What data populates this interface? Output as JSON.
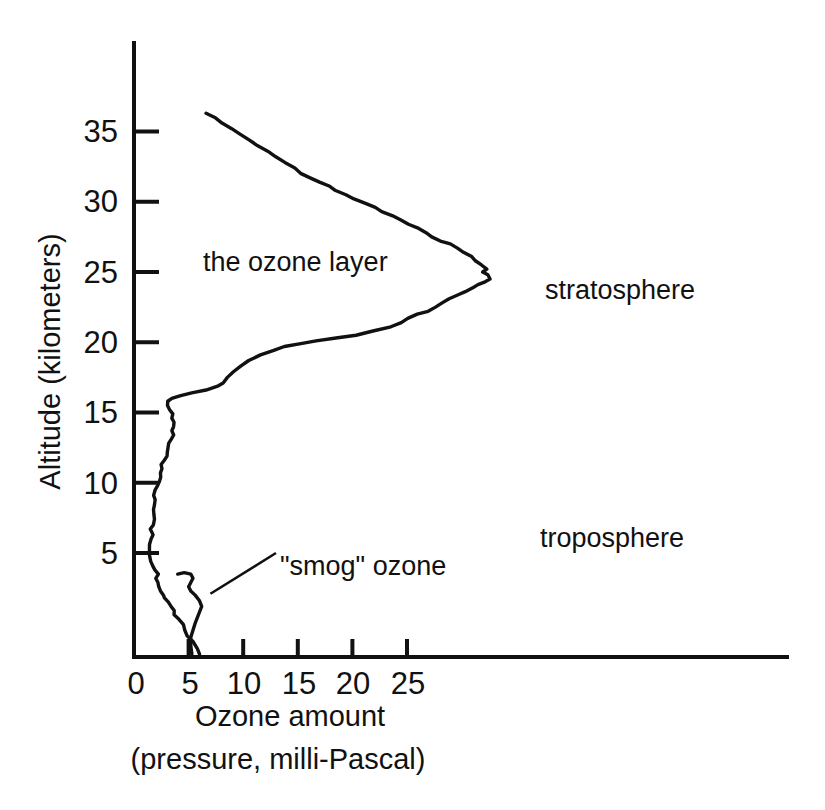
{
  "figure": {
    "background_color": "#ffffff",
    "ink_color": "#111111"
  },
  "axes": {
    "x": {
      "title_line1": "Ozone amount",
      "title_line2": "(pressure, milli-Pascal)",
      "ticks": [
        "0",
        "5",
        "10",
        "15",
        "20",
        "25"
      ],
      "tick_values": [
        0,
        5,
        10,
        15,
        20,
        25
      ],
      "range": [
        0,
        30
      ]
    },
    "y": {
      "title": "Altitude (kilometers)",
      "ticks": [
        "5",
        "10",
        "15",
        "20",
        "25",
        "30",
        "35"
      ],
      "tick_values": [
        5,
        10,
        15,
        20,
        25,
        30,
        35
      ],
      "range": [
        -2.4,
        37
      ]
    }
  },
  "annotations": {
    "ozone_layer": "the ozone layer",
    "stratosphere": "stratosphere",
    "troposphere": "troposphere",
    "smog_ozone": "\"smog\" ozone"
  },
  "chart_data": {
    "type": "line",
    "title": "",
    "xlabel": "Ozone amount (pressure, milli-Pascal)",
    "ylabel": "Altitude (kilometers)",
    "xlim": [
      0,
      30
    ],
    "ylim": [
      -2.4,
      37
    ],
    "xticks": [
      0,
      5,
      10,
      15,
      20,
      25
    ],
    "yticks": [
      5,
      10,
      15,
      20,
      25,
      30,
      35
    ],
    "grid": false,
    "legend": null,
    "orientation": "x = ozone amount, y = altitude",
    "annotations": [
      {
        "text": "the ozone layer",
        "x": 6.3,
        "y": 23.3
      },
      {
        "text": "stratosphere",
        "x": 37.6,
        "y": 21.3
      },
      {
        "text": "troposphere",
        "x": 37.1,
        "y": 7.6
      },
      {
        "text": "\"smog\" ozone",
        "x": 13.4,
        "y": 5.6,
        "leader_from": [
          13.0,
          5.0
        ],
        "leader_to": [
          7.0,
          2.1
        ]
      }
    ],
    "series": [
      {
        "name": "ozone partial pressure profile",
        "points": [
          [
            6.0,
            -2.2
          ],
          [
            5.8,
            -1.8
          ],
          [
            5.4,
            -1.3
          ],
          [
            5.0,
            -0.9
          ],
          [
            4.6,
            -0.5
          ],
          [
            4.4,
            -0.1
          ],
          [
            4.0,
            0.3
          ],
          [
            3.7,
            0.6
          ],
          [
            3.6,
            0.9
          ],
          [
            3.3,
            1.2
          ],
          [
            3.1,
            1.5
          ],
          [
            2.9,
            1.8
          ],
          [
            2.7,
            2.0
          ],
          [
            2.5,
            2.3
          ],
          [
            2.4,
            2.6
          ],
          [
            2.2,
            2.9
          ],
          [
            2.1,
            3.2
          ],
          [
            2.1,
            3.5
          ],
          [
            1.9,
            3.8
          ],
          [
            1.8,
            4.1
          ],
          [
            1.6,
            4.4
          ],
          [
            1.5,
            4.8
          ],
          [
            1.5,
            5.2
          ],
          [
            1.5,
            5.6
          ],
          [
            1.6,
            6.0
          ],
          [
            1.7,
            6.3
          ],
          [
            1.6,
            6.7
          ],
          [
            1.7,
            7.0
          ],
          [
            1.8,
            7.4
          ],
          [
            1.7,
            7.7
          ],
          [
            1.8,
            8.1
          ],
          [
            1.9,
            8.4
          ],
          [
            1.8,
            8.8
          ],
          [
            1.9,
            9.1
          ],
          [
            2.0,
            9.5
          ],
          [
            2.1,
            9.8
          ],
          [
            2.2,
            10.1
          ],
          [
            2.4,
            10.4
          ],
          [
            2.5,
            10.7
          ],
          [
            2.6,
            11.0
          ],
          [
            2.6,
            11.3
          ],
          [
            2.8,
            11.6
          ],
          [
            3.0,
            11.9
          ],
          [
            3.1,
            12.2
          ],
          [
            3.2,
            12.5
          ],
          [
            3.2,
            12.8
          ],
          [
            3.4,
            13.1
          ],
          [
            3.6,
            13.4
          ],
          [
            3.5,
            13.7
          ],
          [
            3.7,
            14.0
          ],
          [
            3.6,
            14.3
          ],
          [
            3.4,
            14.6
          ],
          [
            3.6,
            14.9
          ],
          [
            3.3,
            15.2
          ],
          [
            3.1,
            15.5
          ],
          [
            3.2,
            15.8
          ],
          [
            3.4,
            16.0
          ],
          [
            4.2,
            16.2
          ],
          [
            5.4,
            16.4
          ],
          [
            6.6,
            16.6
          ],
          [
            7.6,
            16.9
          ],
          [
            8.2,
            17.1
          ],
          [
            8.6,
            17.5
          ],
          [
            9.2,
            17.9
          ],
          [
            9.8,
            18.3
          ],
          [
            10.6,
            18.7
          ],
          [
            11.6,
            19.1
          ],
          [
            12.6,
            19.4
          ],
          [
            13.8,
            19.7
          ],
          [
            15.2,
            19.9
          ],
          [
            16.8,
            20.1
          ],
          [
            18.6,
            20.3
          ],
          [
            20.4,
            20.5
          ],
          [
            22.0,
            20.8
          ],
          [
            23.4,
            21.1
          ],
          [
            24.4,
            21.4
          ],
          [
            25.0,
            21.7
          ],
          [
            25.8,
            22.0
          ],
          [
            26.8,
            22.2
          ],
          [
            27.6,
            22.5
          ],
          [
            28.2,
            22.8
          ],
          [
            29.0,
            23.1
          ],
          [
            29.6,
            23.4
          ],
          [
            30.4,
            23.6
          ],
          [
            31.0,
            23.9
          ],
          [
            31.6,
            24.1
          ],
          [
            32.2,
            24.3
          ],
          [
            32.7,
            24.5
          ],
          [
            32.4,
            24.8
          ],
          [
            32.0,
            25.0
          ],
          [
            32.4,
            25.2
          ],
          [
            31.8,
            25.5
          ],
          [
            31.2,
            25.8
          ],
          [
            30.8,
            26.1
          ],
          [
            30.2,
            26.4
          ],
          [
            29.6,
            26.7
          ],
          [
            29.0,
            27.0
          ],
          [
            28.0,
            27.2
          ],
          [
            27.2,
            27.5
          ],
          [
            26.6,
            27.8
          ],
          [
            26.0,
            28.1
          ],
          [
            25.2,
            28.4
          ],
          [
            24.4,
            28.7
          ],
          [
            23.6,
            29.0
          ],
          [
            22.8,
            29.3
          ],
          [
            22.0,
            29.6
          ],
          [
            21.0,
            29.9
          ],
          [
            20.2,
            30.2
          ],
          [
            19.4,
            30.5
          ],
          [
            18.6,
            30.8
          ],
          [
            17.8,
            31.1
          ],
          [
            17.0,
            31.4
          ],
          [
            16.2,
            31.7
          ],
          [
            15.4,
            32.0
          ],
          [
            14.6,
            32.4
          ],
          [
            13.8,
            32.8
          ],
          [
            13.0,
            33.2
          ],
          [
            12.2,
            33.6
          ],
          [
            11.4,
            34.0
          ],
          [
            10.6,
            34.4
          ],
          [
            9.8,
            34.8
          ],
          [
            9.0,
            35.2
          ],
          [
            8.2,
            35.6
          ],
          [
            7.4,
            36.0
          ],
          [
            6.6,
            36.3
          ]
        ]
      },
      {
        "name": "smog ozone near-surface bump",
        "points": [
          [
            4.0,
            3.5
          ],
          [
            4.6,
            3.6
          ],
          [
            5.2,
            3.5
          ],
          [
            5.4,
            3.2
          ],
          [
            5.2,
            2.9
          ],
          [
            5.0,
            2.6
          ],
          [
            5.2,
            2.3
          ],
          [
            5.6,
            2.0
          ],
          [
            6.0,
            1.6
          ],
          [
            6.2,
            1.2
          ],
          [
            6.0,
            0.8
          ],
          [
            5.8,
            0.4
          ],
          [
            5.6,
            0.0
          ],
          [
            5.4,
            -0.5
          ],
          [
            5.2,
            -1.0
          ],
          [
            5.2,
            -1.6
          ],
          [
            5.3,
            -2.2
          ]
        ]
      }
    ]
  }
}
